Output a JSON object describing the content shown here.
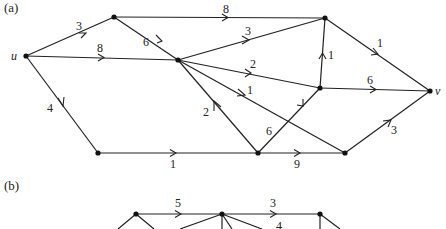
{
  "parts": [
    {
      "label": "(a)",
      "nodes": [
        {
          "id": "u",
          "x": 26,
          "y": 56,
          "label": "u"
        },
        {
          "id": "A",
          "x": 114,
          "y": 17,
          "label": ""
        },
        {
          "id": "B",
          "x": 325,
          "y": 18,
          "label": ""
        },
        {
          "id": "C",
          "x": 178,
          "y": 60,
          "label": ""
        },
        {
          "id": "D",
          "x": 320,
          "y": 88,
          "label": ""
        },
        {
          "id": "v",
          "x": 430,
          "y": 91,
          "label": "v"
        },
        {
          "id": "E",
          "x": 98,
          "y": 153,
          "label": ""
        },
        {
          "id": "F",
          "x": 258,
          "y": 153,
          "label": ""
        },
        {
          "id": "G",
          "x": 345,
          "y": 153,
          "label": ""
        }
      ],
      "edges": [
        {
          "from": "u",
          "to": "A",
          "weight": "3"
        },
        {
          "from": "u",
          "to": "C",
          "weight": "8"
        },
        {
          "from": "u",
          "to": "E",
          "weight": "4"
        },
        {
          "from": "A",
          "to": "B",
          "weight": "8"
        },
        {
          "from": "A",
          "to": "C",
          "weight": "6"
        },
        {
          "from": "C",
          "to": "B",
          "weight": "3"
        },
        {
          "from": "C",
          "to": "D",
          "weight": "2"
        },
        {
          "from": "C",
          "to": "G",
          "weight": "1"
        },
        {
          "from": "F",
          "to": "C",
          "weight": "2"
        },
        {
          "from": "D",
          "to": "B",
          "weight": "1"
        },
        {
          "from": "B",
          "to": "v",
          "weight": "1"
        },
        {
          "from": "D",
          "to": "v",
          "weight": "6"
        },
        {
          "from": "F",
          "to": "D",
          "weight": "6"
        },
        {
          "from": "E",
          "to": "F",
          "weight": "1"
        },
        {
          "from": "F",
          "to": "G",
          "weight": "9"
        },
        {
          "from": "G",
          "to": "v",
          "weight": "3"
        }
      ]
    },
    {
      "label": "(b)",
      "visible_weights": [
        "5",
        "3",
        "4"
      ]
    }
  ]
}
